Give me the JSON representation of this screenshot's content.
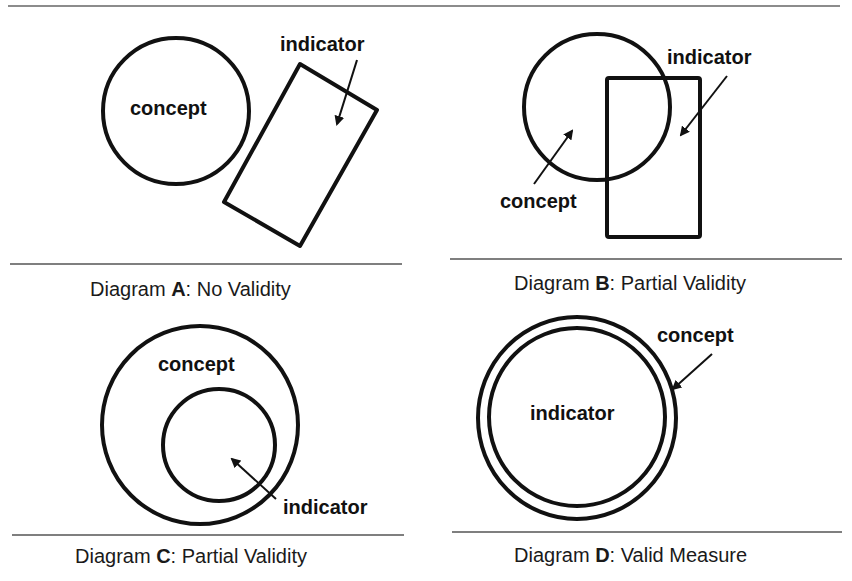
{
  "diagrams": [
    {
      "id": "A",
      "caption_prefix": "Diagram ",
      "caption_letter": "A",
      "caption_suffix": ": No Validity",
      "labels": {
        "concept": "concept",
        "indicator": "indicator"
      }
    },
    {
      "id": "B",
      "caption_prefix": "Diagram ",
      "caption_letter": "B",
      "caption_suffix": ": Partial Validity",
      "labels": {
        "concept": "concept",
        "indicator": "indicator"
      }
    },
    {
      "id": "C",
      "caption_prefix": "Diagram ",
      "caption_letter": "C",
      "caption_suffix": ": Partial Validity",
      "labels": {
        "concept": "concept",
        "indicator": "indicator"
      }
    },
    {
      "id": "D",
      "caption_prefix": "Diagram ",
      "caption_letter": "D",
      "caption_suffix": ": Valid Measure",
      "labels": {
        "concept": "concept",
        "indicator": "indicator"
      }
    }
  ],
  "colors": {
    "stroke": "#111111",
    "rule": "#555555",
    "background": "#ffffff"
  }
}
